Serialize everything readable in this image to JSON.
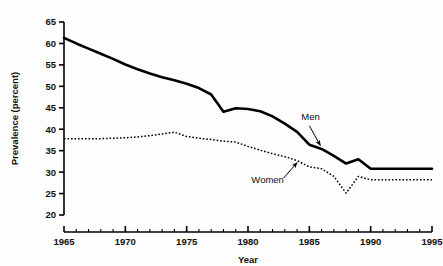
{
  "chart_data": {
    "type": "line",
    "title": "",
    "xlabel": "Year",
    "ylabel": "Prevalence (percent)",
    "xlim": [
      1965,
      1995
    ],
    "ylim": [
      20,
      65
    ],
    "grid": false,
    "legend_position": "inline-annotations",
    "x_major_ticks": [
      1965,
      1970,
      1975,
      1980,
      1985,
      1990,
      1995
    ],
    "x_major_tick_labels": [
      "1965",
      "1970",
      "1975",
      "1980",
      "1985",
      "1990",
      "1995"
    ],
    "x_minor_tick_step": 1,
    "y_major_ticks": [
      20,
      25,
      30,
      35,
      40,
      45,
      50,
      55,
      60,
      65
    ],
    "y_major_tick_labels": [
      "20",
      "25",
      "30",
      "35",
      "40",
      "45",
      "50",
      "55",
      "60",
      "65"
    ],
    "x": [
      1965,
      1966,
      1967,
      1968,
      1969,
      1970,
      1971,
      1972,
      1973,
      1974,
      1975,
      1976,
      1977,
      1978,
      1979,
      1980,
      1981,
      1982,
      1983,
      1984,
      1985,
      1986,
      1987,
      1988,
      1989,
      1990,
      1991,
      1992,
      1993,
      1994,
      1995
    ],
    "series": [
      {
        "name": "Men",
        "style": "solid",
        "color": "#000000",
        "line_width": 2.6,
        "values": [
          61.3,
          60.0,
          58.8,
          57.6,
          56.4,
          55.1,
          54.0,
          53.0,
          52.1,
          51.4,
          50.6,
          49.6,
          48.1,
          44.1,
          44.9,
          44.7,
          44.2,
          43.0,
          41.3,
          39.4,
          36.4,
          35.4,
          33.8,
          32.0,
          33.0,
          30.8,
          30.8,
          30.8,
          30.8,
          30.8,
          30.8
        ]
      },
      {
        "name": "Women",
        "style": "dotted",
        "color": "#000000",
        "line_width": 1.5,
        "values": [
          37.8,
          37.8,
          37.8,
          37.8,
          37.9,
          38.0,
          38.2,
          38.5,
          38.9,
          39.3,
          38.3,
          37.9,
          37.6,
          37.2,
          37.0,
          36.0,
          35.1,
          34.3,
          33.6,
          32.7,
          31.2,
          30.8,
          29.0,
          25.1,
          29.0,
          28.2,
          28.2,
          28.2,
          28.2,
          28.2,
          28.2
        ]
      }
    ],
    "annotations": [
      {
        "label": "Men",
        "text_x": 1985.1,
        "text_y": 42.2,
        "arrow_from_x": 1985.0,
        "arrow_from_y": 40.8,
        "arrow_to_x": 1985.9,
        "arrow_to_y": 36.2
      },
      {
        "label": "Women",
        "text_x": 1981.6,
        "text_y": 27.4,
        "arrow_from_x": 1982.9,
        "arrow_from_y": 28.6,
        "arrow_to_x": 1984.0,
        "arrow_to_y": 32.2
      }
    ]
  }
}
